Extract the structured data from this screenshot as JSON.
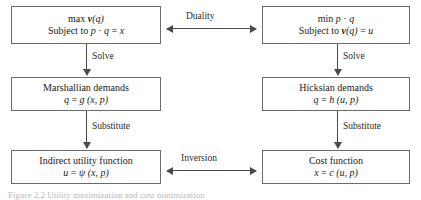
{
  "figure": {
    "kind": "flow-diagram",
    "background_color": "#ffffff",
    "box_border_color": "#6b6b6b",
    "arrow_color": "#4a4a4a",
    "text_color": "#222222",
    "caption": "Figure 2.2  Utility maximization and cost minimization"
  },
  "boxes": {
    "utility_max": {
      "name": "utility-maximization",
      "line1_parts": {
        "op": "max",
        "fn": "v",
        "arg": "(q)"
      },
      "line1_plain": "max v(q)",
      "line2_plain": "Subject to p · q = x",
      "line2_parts": {
        "prefix": "Subject to",
        "lhs": "p · q",
        "eq": "=",
        "rhs": "x"
      }
    },
    "cost_min": {
      "name": "cost-minimization",
      "line1_plain": "min p · q",
      "line1_parts": {
        "op": "min",
        "expr": "p · q"
      },
      "line2_plain": "Subject to v(q) = u",
      "line2_parts": {
        "prefix": "Subject to",
        "fn": "v",
        "arg": "(q)",
        "eq": "=",
        "rhs": "u"
      }
    },
    "marshallian": {
      "name": "marshallian-demands",
      "line1_plain": "Marshallian demands",
      "line2_plain": "q = g (x, p)",
      "line2_parts": {
        "lhs": "q",
        "eq": "=",
        "fn": "g",
        "args": "(x, p)"
      }
    },
    "hicksian": {
      "name": "hicksian-demands",
      "line1_plain": "Hicksian demands",
      "line2_plain": "q = h (u, p)",
      "line2_parts": {
        "lhs": "q",
        "eq": "=",
        "fn": "h",
        "args": "(u, p)"
      }
    },
    "indirect_utility": {
      "name": "indirect-utility-function",
      "line1_plain": "Indirect utility function",
      "line2_plain": "u = ψ (x, p)",
      "line2_parts": {
        "lhs": "u",
        "eq": "=",
        "fn": "ψ",
        "args": "(x, p)"
      }
    },
    "cost_function": {
      "name": "cost-function",
      "line1_plain": "Cost function",
      "line2_plain": "x = c (u, p)",
      "line2_parts": {
        "lhs": "x",
        "eq": "=",
        "fn": "c",
        "args": "(u, p)"
      }
    }
  },
  "edges": {
    "duality": {
      "label": "Duality",
      "style": "double-headed-horizontal"
    },
    "inversion": {
      "label": "Inversion",
      "style": "double-headed-horizontal"
    },
    "solve_left": {
      "label": "Solve",
      "style": "down"
    },
    "solve_right": {
      "label": "Solve",
      "style": "down"
    },
    "substitute_left": {
      "label": "Substitute",
      "style": "down"
    },
    "substitute_right": {
      "label": "Substitute",
      "style": "down"
    }
  }
}
